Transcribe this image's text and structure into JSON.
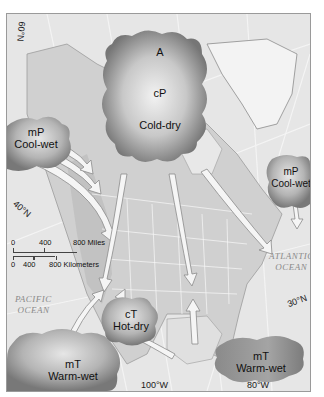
{
  "map": {
    "title": "North American Air Masses",
    "colors": {
      "background": "#e4e4e4",
      "land": "#d2d2d2",
      "greenland": "#f2f2f2",
      "ocean": "#e8e8e8",
      "cloud_dark": "#7a7a7a",
      "cloud_light": "#f0f0f0",
      "arrow_fill": "#f4f4f4",
      "arrow_stroke": "#8c8c8c"
    },
    "air_masses": [
      {
        "id": "arctic-continental-polar",
        "lines": [
          "A",
          "cP",
          "Cold-dry"
        ]
      },
      {
        "id": "mp-pacific",
        "lines": [
          "mP",
          "Cool-wet"
        ]
      },
      {
        "id": "mp-atlantic",
        "lines": [
          "mP",
          "Cool-wet"
        ]
      },
      {
        "id": "ct",
        "lines": [
          "cT",
          "Hot-dry"
        ]
      },
      {
        "id": "mt-pacific",
        "lines": [
          "mT",
          "Warm-wet"
        ]
      },
      {
        "id": "mt-gulf",
        "lines": [
          "mT",
          "Warm-wet"
        ]
      }
    ],
    "latitude_labels": [
      "60°N",
      "40°N",
      "30°N"
    ],
    "longitude_labels": [
      "100°W",
      "80°W"
    ],
    "oceans": [
      {
        "name": "PACIFIC",
        "name2": "OCEAN"
      },
      {
        "name": "ATLANTIC",
        "name2": "OCEAN"
      }
    ],
    "scale": {
      "miles": [
        "0",
        "400",
        "800 Miles"
      ],
      "kilometers": [
        "0",
        "400",
        "800 Kilometers"
      ]
    }
  }
}
